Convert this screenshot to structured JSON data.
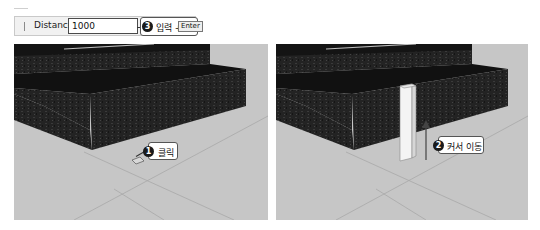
{
  "toolbar": {
    "label": "Distance",
    "value": "1000"
  },
  "callouts": {
    "step3": {
      "number": "3",
      "text": "입력 +",
      "key": "Enter"
    },
    "step1": {
      "number": "1",
      "text": "클릭"
    },
    "step2": {
      "number": "2",
      "text": "커서 이동"
    }
  },
  "panels": {
    "left": {
      "description": "3D stairs scene, cursor clicked on ground"
    },
    "right": {
      "description": "3D stairs scene with white box extruded upward"
    }
  },
  "colors": {
    "viewport_bg": "#c6c6c6",
    "stone": "#1e1e1e",
    "callout_border": "#555555",
    "badge": "#1a1a1a"
  }
}
